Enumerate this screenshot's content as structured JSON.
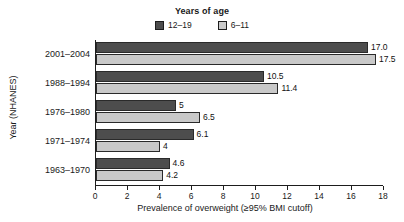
{
  "chart_data": {
    "type": "bar",
    "orientation": "horizontal",
    "title": "",
    "xlabel": "Prevalence of overweight (≥95% BMI cutoff)",
    "ylabel": "Year (NHANES)",
    "xlim": [
      0,
      18
    ],
    "xticks": [
      0,
      2,
      4,
      6,
      8,
      10,
      12,
      14,
      16,
      18
    ],
    "xtick_labels": [
      "0",
      "2",
      "4",
      "6",
      "8",
      "10",
      "12",
      "14",
      "16",
      "18"
    ],
    "grid": false,
    "legend": {
      "title": "Years of age",
      "position": "top-center",
      "entries": [
        {
          "name": "12–19",
          "color": "#4d4d4d"
        },
        {
          "name": "6–11",
          "color": "#c9c9c9"
        }
      ]
    },
    "categories": [
      "2001–2004",
      "1988–1994",
      "1976–1980",
      "1971–1974",
      "1963–1970"
    ],
    "series": [
      {
        "name": "12–19",
        "color": "#4d4d4d",
        "values": [
          17.0,
          10.5,
          5,
          6.1,
          4.6
        ],
        "labels": [
          "17.0",
          "10.5",
          "5",
          "6.1",
          "4.6"
        ]
      },
      {
        "name": "6–11",
        "color": "#c9c9c9",
        "values": [
          17.5,
          11.4,
          6.5,
          4,
          4.2
        ],
        "labels": [
          "17.5",
          "11.4",
          "6.5",
          "4",
          "4.2"
        ]
      }
    ]
  }
}
